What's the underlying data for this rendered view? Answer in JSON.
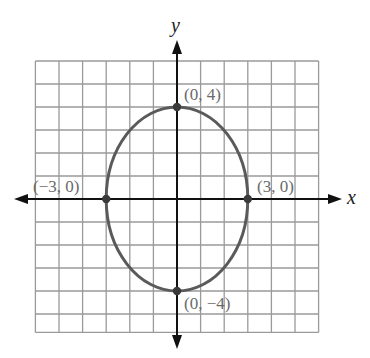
{
  "figure": {
    "type": "ellipse-graph",
    "equation_implied": "x^2/9 + y^2/16 = 1",
    "axes": {
      "x_label": "x",
      "y_label": "y",
      "grid_x_range": [
        -6,
        6
      ],
      "grid_y_range": [
        -5.8,
        6
      ],
      "grid_step": 1
    },
    "ellipse": {
      "center": [
        0,
        0
      ],
      "semi_axis_x": 3,
      "semi_axis_y": 4,
      "stroke_color": "#5a5a5a"
    },
    "points": [
      {
        "x": 0,
        "y": 4,
        "label": "(0, 4)"
      },
      {
        "x": -3,
        "y": 0,
        "label": "(−3, 0)"
      },
      {
        "x": 3,
        "y": 0,
        "label": "(3, 0)"
      },
      {
        "x": 0,
        "y": -4,
        "label": "(0, −4)"
      }
    ],
    "colors": {
      "grid": "#9a9a9a",
      "axis": "#111111",
      "curve": "#5a5a5a",
      "label": "#6a6a6a"
    }
  }
}
